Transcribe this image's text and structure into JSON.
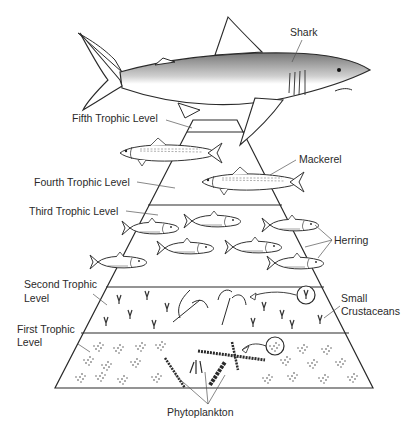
{
  "diagram": {
    "type": "ecological energy pyramid / marine food chain",
    "levels": [
      {
        "name": "Fifth Trophic Level",
        "organisms": "Shark"
      },
      {
        "name": "Fourth Trophic Level",
        "organisms": "Mackerel"
      },
      {
        "name": "Third Trophic Level",
        "organisms": "Herring"
      },
      {
        "name": "Second Trophic Level",
        "organisms": "Small Crustaceans"
      },
      {
        "name": "First Trophic Level",
        "organisms": "Phytoplankton"
      }
    ]
  },
  "labels": {
    "shark": "Shark",
    "fifth": "Fifth Trophic Level",
    "mackerel": "Mackerel",
    "fourth": "Fourth Trophic Level",
    "third": "Third Trophic Level",
    "herring": "Herring",
    "second_line1": "Second Trophic",
    "second_line2": "Level",
    "small": "Small",
    "crustaceans": "Crustaceans",
    "first_line1": "First Trophic",
    "first_line2": "Level",
    "phytoplankton": "Phytoplankton"
  },
  "colors": {
    "ink": "#2a2a2a",
    "background": "#ffffff"
  }
}
